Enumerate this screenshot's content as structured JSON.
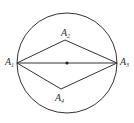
{
  "diagram": {
    "type": "geometry",
    "stroke_color": "#333333",
    "circle": {
      "cx": 67,
      "cy": 63,
      "r": 50
    },
    "center_point": {
      "x": 67,
      "y": 63
    },
    "points": [
      {
        "id": "A1",
        "letter": "A",
        "sub": "1",
        "x": 17,
        "y": 63
      },
      {
        "id": "A2",
        "letter": "A",
        "sub": "2",
        "x": 65,
        "y": 40
      },
      {
        "id": "A3",
        "letter": "A",
        "sub": "3",
        "x": 117,
        "y": 63
      },
      {
        "id": "A4",
        "letter": "A",
        "sub": "4",
        "x": 61,
        "y": 89
      }
    ],
    "segments": [
      [
        "A1",
        "A2"
      ],
      [
        "A2",
        "A3"
      ],
      [
        "A1",
        "A3"
      ],
      [
        "A1",
        "A4"
      ],
      [
        "A4",
        "A3"
      ]
    ]
  }
}
